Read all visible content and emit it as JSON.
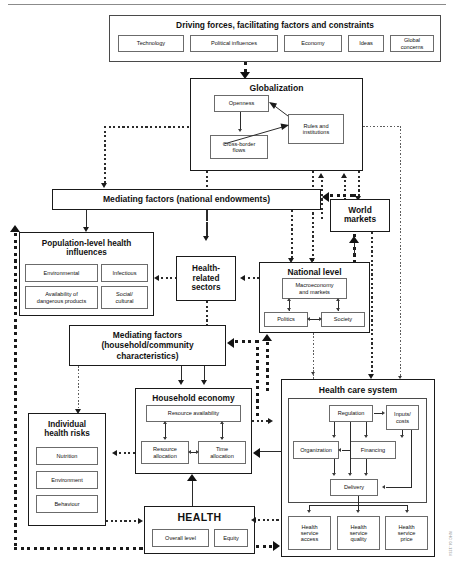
{
  "figure": {
    "credit": "WHO 04-1234"
  },
  "driving_forces": {
    "title": "Driving forces, facilitating factors and constraints",
    "items": [
      {
        "label": "Technology"
      },
      {
        "label": "Political influences"
      },
      {
        "label": "Economy"
      },
      {
        "label": "Ideas"
      },
      {
        "label": "Global concerns"
      }
    ]
  },
  "globalization": {
    "title": "Globalization",
    "items": [
      {
        "label": "Openness"
      },
      {
        "label": "Cross-border\nflows"
      },
      {
        "label": "Rules and\ninstitutions"
      }
    ]
  },
  "mediating_national": {
    "title": "Mediating factors (national endowments)"
  },
  "world_markets": {
    "title": "World\nmarkets"
  },
  "population_health": {
    "title": "Population-level health influences",
    "items": [
      {
        "label": "Environmental"
      },
      {
        "label": "Infectious"
      },
      {
        "label": "Availability of dangerous products"
      },
      {
        "label": "Social/ cultural"
      }
    ]
  },
  "health_related_sectors": {
    "title": "Health-\nrelated\nsectors"
  },
  "national_level": {
    "title": "National level",
    "items": [
      {
        "label": "Macroeconomy and markets"
      },
      {
        "label": "Politics"
      },
      {
        "label": "Society"
      }
    ]
  },
  "mediating_household": {
    "title": "Mediating factors (household/community characteristics)"
  },
  "household_economy": {
    "title": "Household economy",
    "items": [
      {
        "label": "Resource availability"
      },
      {
        "label": "Resource allocation"
      },
      {
        "label": "Time allocation"
      }
    ]
  },
  "individual_risks": {
    "title": "Individual\nhealth risks",
    "items": [
      {
        "label": "Nutrition"
      },
      {
        "label": "Environment"
      },
      {
        "label": "Behaviour"
      }
    ]
  },
  "health": {
    "title": "HEALTH",
    "items": [
      {
        "label": "Overall level"
      },
      {
        "label": "Equity"
      }
    ]
  },
  "health_care_system": {
    "title": "Health care system",
    "items": [
      {
        "label": "Regulation"
      },
      {
        "label": "Inputs/ costs"
      },
      {
        "label": "Organization"
      },
      {
        "label": "Financing"
      },
      {
        "label": "Delivery"
      }
    ],
    "outcomes": [
      {
        "label": "Health service access"
      },
      {
        "label": "Health service quality"
      },
      {
        "label": "Health service price"
      }
    ]
  }
}
